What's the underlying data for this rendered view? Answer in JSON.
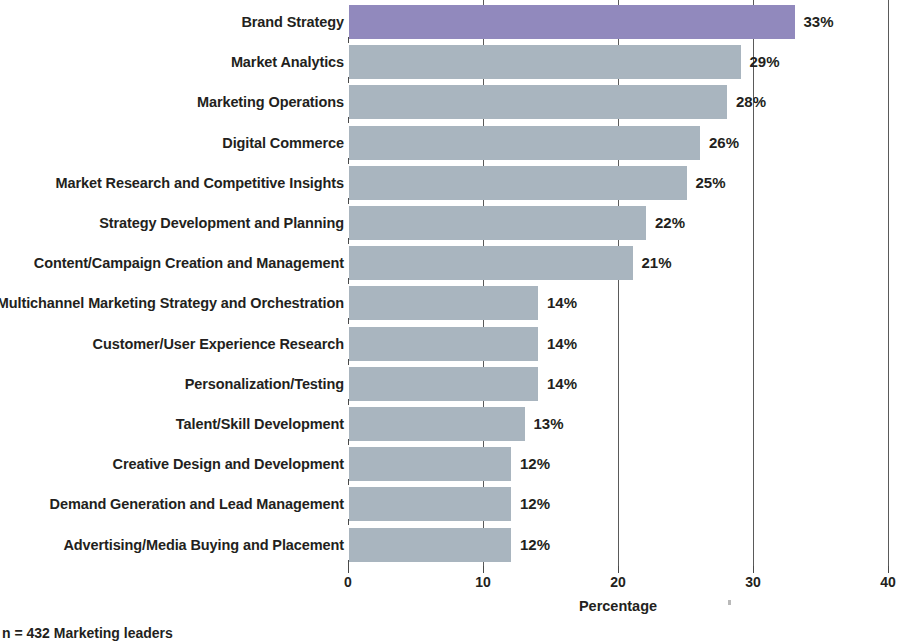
{
  "chart_data": {
    "type": "bar",
    "orientation": "horizontal",
    "title": "",
    "xlabel": "Percentage",
    "ylabel": "",
    "xlim": [
      0,
      40
    ],
    "xticks": [
      "0",
      "10",
      "20",
      "30",
      "40"
    ],
    "grid": "vertical gridlines at 10, 20, 30, 40",
    "legend": "none",
    "value_suffix": "%",
    "footnote": "n = 432 Marketing leaders",
    "highlight_color": "#9189bd",
    "bar_color": "#a9b5bf",
    "categories": [
      "Brand Strategy",
      "Market Analytics",
      "Marketing Operations",
      "Digital Commerce",
      "Market Research and Competitive Insights",
      "Strategy Development and Planning",
      "Content/Campaign Creation and Management",
      "Multichannel Marketing Strategy and Orchestration",
      "Customer/User Experience Research",
      "Personalization/Testing",
      "Talent/Skill Development",
      "Creative Design and Development",
      "Demand Generation and Lead Management",
      "Advertising/Media Buying and Placement"
    ],
    "values": [
      33,
      29,
      28,
      26,
      25,
      22,
      21,
      14,
      14,
      14,
      13,
      12,
      12,
      12
    ],
    "value_labels": [
      "33%",
      "29%",
      "28%",
      "26%",
      "25%",
      "22%",
      "21%",
      "14%",
      "14%",
      "14%",
      "13%",
      "12%",
      "12%",
      "12%"
    ],
    "highlighted": [
      true,
      false,
      false,
      false,
      false,
      false,
      false,
      false,
      false,
      false,
      false,
      false,
      false,
      false
    ]
  }
}
